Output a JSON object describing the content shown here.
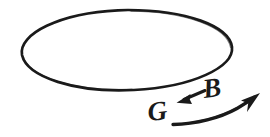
{
  "figure": {
    "kind": "hand-drawn-sketch",
    "background_color": "#ffffff",
    "ink_color": "#1a1a1a",
    "width": 270,
    "height": 137
  },
  "shapes": {
    "ellipse": {
      "name": "orbit-ellipse",
      "center_x": 127,
      "center_y": 50,
      "radius_x": 105,
      "radius_y": 40,
      "stroke_width": 2.6
    },
    "small_arrow": {
      "name": "B-to-G-arrow",
      "direction": "left-down",
      "tail_x": 204,
      "tail_y": 91,
      "head_x": 178,
      "head_y": 101,
      "stroke_width": 3.2
    },
    "curved_arrow": {
      "name": "motion-arrow",
      "direction": "up-right",
      "tail_x": 173,
      "tail_y": 124,
      "head_x": 257,
      "head_y": 96,
      "stroke_width": 3.4
    }
  },
  "labels": {
    "g_label": "G",
    "b_label": "B"
  }
}
